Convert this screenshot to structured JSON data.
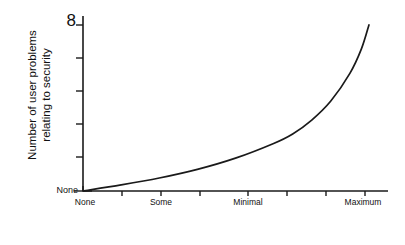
{
  "chart_data": {
    "type": "line",
    "title": "",
    "subtitle": "",
    "xlabel": "Amount of security",
    "ylabel": "Number of user problems relating to security",
    "ylabel_lines": [
      "Number of user problems",
      "relating to security"
    ],
    "grid": false,
    "legend": "none",
    "background": "#ffffff",
    "line_color": "#1a1a1a",
    "axis_color": "#1a1a1a",
    "xlim": [
      0,
      8
    ],
    "ylim": [
      0,
      1
    ],
    "x_tick_count": 8,
    "y_tick_count": 6,
    "x_tick_labels": [
      {
        "index": 0,
        "label": "None"
      },
      {
        "index": 2,
        "label": "Some"
      },
      {
        "index": 4,
        "label": "Minimal"
      },
      {
        "index": 7,
        "label": "Maximum"
      }
    ],
    "y_tick_labels": [
      {
        "position": "top",
        "label": "8",
        "meaning": "infinity"
      },
      {
        "position": "bottom",
        "label": "None",
        "meaning": "zero"
      }
    ],
    "series": [
      {
        "name": "User problems vs security",
        "shape": "exponential-growth",
        "x": [
          0.0,
          1.0,
          2.0,
          3.0,
          4.0,
          5.0,
          5.5,
          6.0,
          6.5,
          7.0,
          7.3,
          7.5
        ],
        "values": [
          0.0,
          0.035,
          0.075,
          0.125,
          0.19,
          0.275,
          0.33,
          0.41,
          0.52,
          0.68,
          0.82,
          0.96
        ]
      }
    ],
    "annotations": []
  },
  "axis_titles": {
    "x": "Amount of security",
    "y_line1": "Number of user problems",
    "y_line2": "relating to security"
  },
  "ticks": {
    "y_top": "8",
    "y_bottom": "None",
    "x0": "None",
    "x2": "Some",
    "x4": "Minimal",
    "x7": "Maximum"
  }
}
